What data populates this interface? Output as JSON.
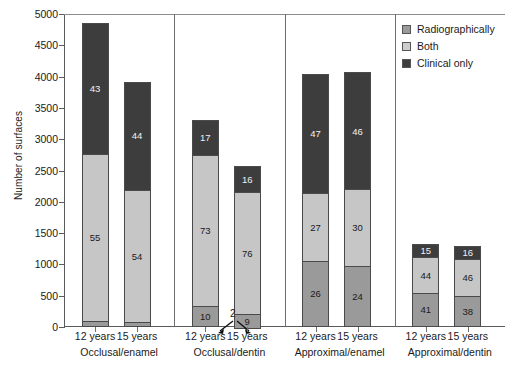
{
  "chart_data": {
    "type": "bar",
    "subtype": "stacked-bar-grouped",
    "title": "",
    "xlabel": "",
    "ylabel": "Number of surfaces",
    "ylim": [
      0,
      5000
    ],
    "ytick_step": 500,
    "yticks": [
      "5000",
      "4500",
      "4000",
      "3500",
      "3000",
      "2500",
      "2000",
      "1500",
      "1000",
      "500",
      "0"
    ],
    "grid": false,
    "legend_position": "top-right",
    "stack_order_bottom_to_top": [
      "Radiographically",
      "Both",
      "Clinical only"
    ],
    "legend": [
      {
        "name": "Radiographically",
        "color": "#9a9a9a"
      },
      {
        "name": "Both",
        "color": "#cdcdcd"
      },
      {
        "name": "Clinical only",
        "color": "#3d3d3d"
      }
    ],
    "groups": [
      {
        "name": "Occlusal/enamel",
        "bars": [
          {
            "category": "12 years",
            "total": 4850,
            "segments": [
              {
                "series": "Radiographically",
                "label": "2",
                "percent": 2,
                "value": 97
              },
              {
                "series": "Both",
                "label": "55",
                "percent": 55,
                "value": 2668
              },
              {
                "series": "Clinical only",
                "label": "43",
                "percent": 43,
                "value": 2086
              }
            ]
          },
          {
            "category": "15 years",
            "total": 3920,
            "segments": [
              {
                "series": "Radiographically",
                "label": "2",
                "percent": 2,
                "value": 78
              },
              {
                "series": "Both",
                "label": "54",
                "percent": 54,
                "value": 2117
              },
              {
                "series": "Clinical only",
                "label": "44",
                "percent": 44,
                "value": 1725
              }
            ]
          }
        ]
      },
      {
        "name": "Occlusal/dentin",
        "bars": [
          {
            "category": "12 years",
            "total": 3310,
            "segments": [
              {
                "series": "Radiographically",
                "label": "10",
                "percent": 10,
                "value": 331
              },
              {
                "series": "Both",
                "label": "73",
                "percent": 73,
                "value": 2416
              },
              {
                "series": "Clinical only",
                "label": "17",
                "percent": 17,
                "value": 563
              }
            ]
          },
          {
            "category": "15 years",
            "total": 2570,
            "segments": [
              {
                "series": "Radiographically",
                "label": "9",
                "percent": 9,
                "value": 231
              },
              {
                "series": "Both",
                "label": "76",
                "percent": 76,
                "value": 1953
              },
              {
                "series": "Clinical only",
                "label": "16",
                "percent": 16,
                "value": 411
              }
            ]
          }
        ]
      },
      {
        "name": "Approximal/enamel",
        "bars": [
          {
            "category": "12 years",
            "total": 4040,
            "segments": [
              {
                "series": "Radiographically",
                "label": "26",
                "percent": 26,
                "value": 1050
              },
              {
                "series": "Both",
                "label": "27",
                "percent": 27,
                "value": 1091
              },
              {
                "series": "Clinical only",
                "label": "47",
                "percent": 47,
                "value": 1899
              }
            ]
          },
          {
            "category": "15 years",
            "total": 4070,
            "segments": [
              {
                "series": "Radiographically",
                "label": "24",
                "percent": 24,
                "value": 977
              },
              {
                "series": "Both",
                "label": "30",
                "percent": 30,
                "value": 1221
              },
              {
                "series": "Clinical only",
                "label": "46",
                "percent": 46,
                "value": 1872
              }
            ]
          }
        ]
      },
      {
        "name": "Approximal/dentin",
        "bars": [
          {
            "category": "12 years",
            "total": 1320,
            "segments": [
              {
                "series": "Radiographically",
                "label": "41",
                "percent": 41,
                "value": 541
              },
              {
                "series": "Both",
                "label": "44",
                "percent": 44,
                "value": 581
              },
              {
                "series": "Clinical only",
                "label": "15",
                "percent": 15,
                "value": 198
              }
            ]
          },
          {
            "category": "15 years",
            "total": 1300,
            "segments": [
              {
                "series": "Radiographically",
                "label": "38",
                "percent": 38,
                "value": 494
              },
              {
                "series": "Both",
                "label": "46",
                "percent": 46,
                "value": 598
              },
              {
                "series": "Clinical only",
                "label": "16",
                "percent": 16,
                "value": 208
              }
            ]
          }
        ]
      }
    ],
    "annotations": [
      {
        "id": "small-segment-callout",
        "text": "2",
        "points_to": [
          "Occlusal/enamel 12 years radiographically",
          "Occlusal/enamel 15 years radiographically"
        ]
      }
    ]
  }
}
